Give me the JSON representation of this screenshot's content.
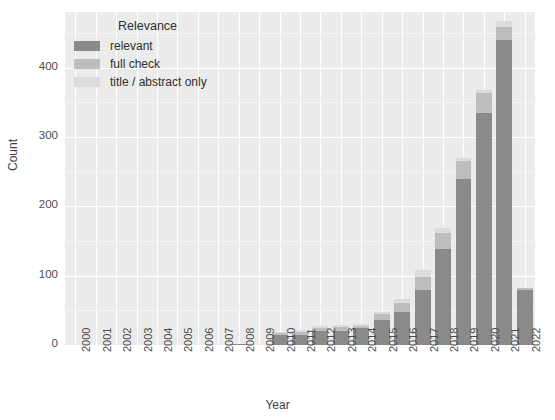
{
  "chart_data": {
    "type": "bar",
    "stacked": true,
    "title": "",
    "xlabel": "Year",
    "ylabel": "Count",
    "ylim": [
      0,
      480
    ],
    "yticks": [
      0,
      100,
      200,
      300,
      400
    ],
    "ytick_labels": [
      "0",
      "100",
      "200",
      "300",
      "400"
    ],
    "grid": true,
    "legend_position": "upper left",
    "legend_title": "Relevance",
    "categories": [
      "2000",
      "2001",
      "2002",
      "2003",
      "2004",
      "2005",
      "2006",
      "2007",
      "2008",
      "2009",
      "2010",
      "2011",
      "2012",
      "2013",
      "2014",
      "2015",
      "2016",
      "2017",
      "2018",
      "2019",
      "2020",
      "2021",
      "2022"
    ],
    "series": [
      {
        "name": "relevant",
        "color": "#8a8a8a",
        "values": [
          0,
          0,
          0,
          0,
          0,
          0,
          0,
          0,
          1,
          0,
          15,
          15,
          20,
          20,
          24,
          36,
          48,
          80,
          138,
          240,
          335,
          440,
          80
        ]
      },
      {
        "name": "full check",
        "color": "#bdbdbd",
        "values": [
          0,
          0,
          0,
          0,
          0,
          0,
          0,
          0,
          0,
          0,
          3,
          4,
          4,
          6,
          4,
          8,
          12,
          18,
          24,
          25,
          28,
          18,
          2
        ]
      },
      {
        "name": "title / abstract only",
        "color": "#dcdcdc",
        "values": [
          0,
          0,
          0,
          0,
          0,
          0,
          0,
          0,
          0,
          0,
          1,
          2,
          3,
          3,
          2,
          4,
          7,
          10,
          6,
          5,
          4,
          9,
          0
        ]
      }
    ],
    "totals": [
      0,
      0,
      0,
      0,
      0,
      0,
      0,
      0,
      1,
      0,
      19,
      21,
      27,
      29,
      30,
      48,
      67,
      108,
      168,
      270,
      367,
      467,
      82
    ]
  },
  "legend": {
    "title": "Relevance",
    "entries": [
      {
        "label": "relevant",
        "color": "#8a8a8a"
      },
      {
        "label": "full check",
        "color": "#bdbdbd"
      },
      {
        "label": "title / abstract only",
        "color": "#dcdcdc"
      }
    ]
  },
  "axes": {
    "y_label": "Count",
    "x_label": "Year"
  },
  "colors": {
    "plot_background": "#ebebeb",
    "gridline": "#ffffff",
    "relevant": "#8a8a8a",
    "full_check": "#bdbdbd",
    "title_abstract": "#dcdcdc",
    "text": "#3d3d3d"
  }
}
